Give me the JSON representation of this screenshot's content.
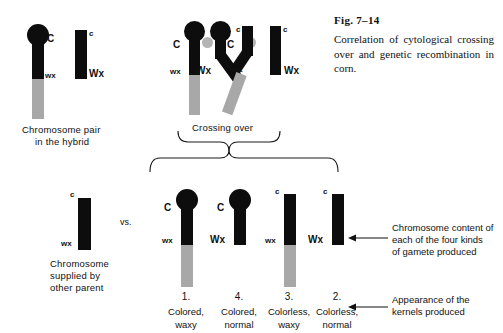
{
  "figure": {
    "number": "Fig. 7–14",
    "caption": "Correlation of cytological crossing over and genetic recombination in corn."
  },
  "panels": {
    "hybrid": {
      "caption_line1": "Chromosome pair",
      "caption_line2": "in the hybrid",
      "chromosomes": [
        {
          "knob": "yes",
          "top_allele": "C",
          "bottom_allele": "wx",
          "gray_tail": "yes"
        },
        {
          "knob": "no",
          "top_allele": "c",
          "bottom_allele": "Wx",
          "gray_tail": "no"
        }
      ]
    },
    "crossing_over": {
      "caption": "Crossing over",
      "chromatids": [
        {
          "knob": "yes",
          "top_allele": "C",
          "bottom_allele": "wx",
          "gray_tail": "yes"
        },
        {
          "knob": "yes",
          "top_allele": "C",
          "bottom_allele": "Wx",
          "gray_tail": "no"
        },
        {
          "knob": "no",
          "top_allele": "c",
          "bottom_allele": "wx",
          "gray_tail": "yes"
        },
        {
          "knob": "no",
          "top_allele": "c",
          "bottom_allele": "Wx",
          "gray_tail": "no"
        }
      ]
    },
    "other_parent": {
      "caption_line1": "Chromosome",
      "caption_line2": "supplied by",
      "caption_line3": "other parent",
      "top_allele": "c",
      "bottom_allele": "wx",
      "vs_label": "vs."
    },
    "gametes": [
      {
        "number": "1.",
        "top_allele": "C",
        "bottom_allele": "wx",
        "knob": "yes",
        "gray_tail": "yes",
        "phenotype_line1": "Colored,",
        "phenotype_line2": "waxy"
      },
      {
        "number": "4.",
        "top_allele": "C",
        "bottom_allele": "Wx",
        "knob": "yes",
        "gray_tail": "no",
        "phenotype_line1": "Colored,",
        "phenotype_line2": "normal"
      },
      {
        "number": "3.",
        "top_allele": "c",
        "bottom_allele": "wx",
        "knob": "no",
        "gray_tail": "yes",
        "phenotype_line1": "Colorless,",
        "phenotype_line2": "waxy"
      },
      {
        "number": "2.",
        "top_allele": "c",
        "bottom_allele": "Wx",
        "knob": "no",
        "gray_tail": "no",
        "phenotype_line1": "Colorless,",
        "phenotype_line2": "normal"
      }
    ]
  },
  "annotations": {
    "gamete_content": {
      "line1": "Chromosome content of",
      "line2": "each of the four kinds",
      "line3": "of gamete produced"
    },
    "kernel_appearance": {
      "line1": "Appearance of the",
      "line2": "kernels produced"
    }
  },
  "colors": {
    "ink": "#0d0d0d",
    "gray_segment": "#a8a8a8",
    "background": "#ffffff"
  }
}
